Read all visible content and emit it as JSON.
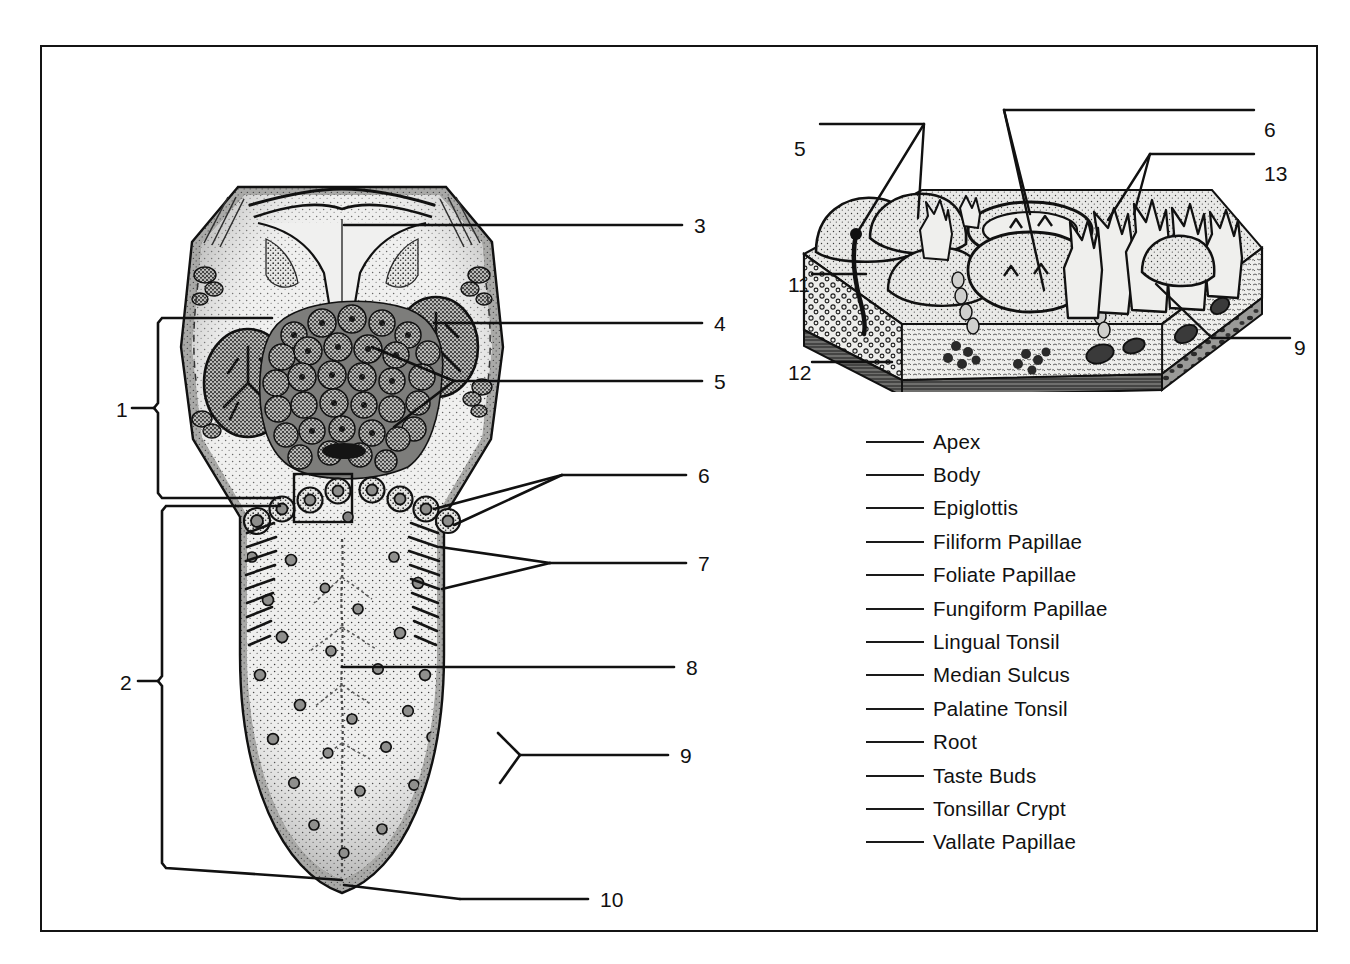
{
  "figure": {
    "frame_color": "#141414",
    "background": "#ffffff",
    "ink_color": "#111111"
  },
  "tongue_diagram": {
    "name": "dorsal-surface-of-tongue",
    "callouts": [
      {
        "id": "1",
        "label": "1",
        "x": 74,
        "y": 361,
        "type": "bracket"
      },
      {
        "id": "2",
        "label": "2",
        "x": 78,
        "y": 634,
        "type": "bracket"
      },
      {
        "id": "3",
        "label": "3",
        "x": 652,
        "y": 170,
        "type": "leader"
      },
      {
        "id": "4",
        "label": "4",
        "x": 670,
        "y": 267,
        "type": "leader"
      },
      {
        "id": "5",
        "label": "5",
        "x": 670,
        "y": 326,
        "type": "leader"
      },
      {
        "id": "6",
        "label": "6",
        "x": 655,
        "y": 420,
        "type": "leader"
      },
      {
        "id": "7",
        "label": "7",
        "x": 655,
        "y": 508,
        "type": "leader"
      },
      {
        "id": "8",
        "label": "8",
        "x": 642,
        "y": 612,
        "type": "leader"
      },
      {
        "id": "9",
        "label": "9",
        "x": 638,
        "y": 700,
        "type": "leader"
      },
      {
        "id": "10",
        "label": "10",
        "x": 557,
        "y": 845,
        "type": "leader"
      }
    ]
  },
  "histology_block": {
    "name": "papillae-tissue-block-cutaway",
    "callouts": [
      {
        "id": "5",
        "label": "5",
        "x": 752,
        "y": 91,
        "type": "leader"
      },
      {
        "id": "6",
        "label": "6",
        "x": 1222,
        "y": 74,
        "type": "leader"
      },
      {
        "id": "13",
        "label": "13",
        "x": 1222,
        "y": 119,
        "type": "leader"
      },
      {
        "id": "11",
        "label": "11",
        "x": 750,
        "y": 228,
        "type": "leader"
      },
      {
        "id": "12",
        "label": "12",
        "x": 750,
        "y": 316,
        "type": "leader"
      },
      {
        "id": "9",
        "label": "9",
        "x": 1252,
        "y": 290,
        "type": "leader"
      }
    ]
  },
  "answer_list": {
    "name": "term-answer-blanks",
    "items": [
      {
        "term": "Apex"
      },
      {
        "term": "Body"
      },
      {
        "term": "Epiglottis"
      },
      {
        "term": "Filiform Papillae"
      },
      {
        "term": "Foliate Papillae"
      },
      {
        "term": "Fungiform Papillae"
      },
      {
        "term": "Lingual Tonsil"
      },
      {
        "term": "Median Sulcus"
      },
      {
        "term": "Palatine Tonsil"
      },
      {
        "term": "Root"
      },
      {
        "term": "Taste Buds"
      },
      {
        "term": "Tonsillar Crypt"
      },
      {
        "term": "Vallate Papillae"
      }
    ]
  }
}
